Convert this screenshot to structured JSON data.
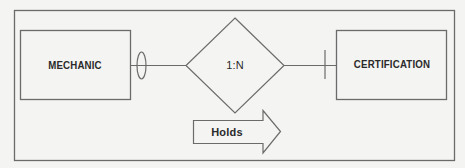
{
  "diagram": {
    "type": "entity-relationship",
    "frame": {
      "stroke": "#6b6b6b"
    },
    "entities": [
      {
        "id": "mechanic",
        "label": "MECHANIC"
      },
      {
        "id": "certification",
        "label": "CERTIFICATION"
      }
    ],
    "relationship": {
      "label": "1:N",
      "shape": "diamond",
      "left_connector": "optional-oval",
      "right_connector": "mandatory-bar"
    },
    "direction_arrow": {
      "label": "Holds",
      "direction": "right"
    },
    "colors": {
      "background": "#f4f4f2",
      "stroke": "#6b6b6b",
      "text": "#2a2a2a"
    }
  }
}
